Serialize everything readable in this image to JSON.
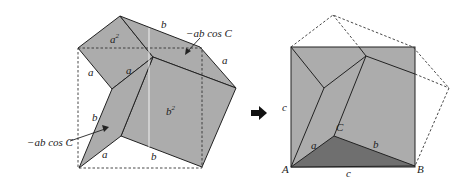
{
  "figure": {
    "colors": {
      "fill_light": "#acacac",
      "fill_dark": "#6f6f6f",
      "stroke": "#222222",
      "dashed": "#333333",
      "highlight": "#f2f2f2"
    },
    "left_panel": {
      "labels": {
        "a_squared_base": "a",
        "a_squared_exp": "2",
        "b_squared_base": "b",
        "b_squared_exp": "2",
        "top_b": "b",
        "top_right_annotation": "−ab cos C",
        "right_a": "a",
        "left_a": "a",
        "inner_a": "a",
        "left_b": "b",
        "left_annotation": "−ab cos C",
        "bottom_a": "a",
        "bottom_b": "b"
      }
    },
    "arrow": {
      "icon": "right-arrow"
    },
    "right_panel": {
      "labels": {
        "side_c_left": "c",
        "vertex_C": "C",
        "side_a": "a",
        "side_b": "b",
        "vertex_A": "A",
        "side_c_bottom": "c",
        "vertex_B": "B"
      }
    }
  }
}
